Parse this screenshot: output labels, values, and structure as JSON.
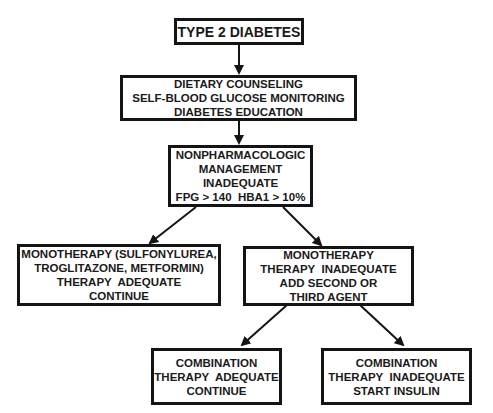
{
  "diagram": {
    "type": "flowchart",
    "nodes": {
      "start": {
        "lines": [
          "TYPE 2 DIABETES"
        ]
      },
      "lifestyle": {
        "lines": [
          "DIETARY COUNSELING",
          "SELF-BLOOD GLUCOSE MONITORING",
          "DIABETES EDUCATION"
        ]
      },
      "nonpharm": {
        "lines": [
          "NONPHARMACOLOGIC",
          "MANAGEMENT",
          "INADEQUATE",
          "FPG > 140  HBA1 > 10%"
        ]
      },
      "mono_adequate": {
        "lines": [
          "MONOTHERAPY (SULFONYLUREA,",
          "TROGLITAZONE, METFORMIN)",
          "THERAPY  ADEQUATE",
          "CONTINUE"
        ]
      },
      "mono_inadequate": {
        "lines": [
          "MONOTHERAPY",
          "THERAPY  INADEQUATE",
          "ADD SECOND OR",
          "THIRD AGENT"
        ]
      },
      "combo_adequate": {
        "lines": [
          "COMBINATION",
          "THERAPY  ADEQUATE",
          "CONTINUE"
        ]
      },
      "combo_inadequate": {
        "lines": [
          "COMBINATION",
          "THERAPY  INADEQUATE",
          "START INSULIN"
        ]
      }
    },
    "edges": [
      [
        "start",
        "lifestyle"
      ],
      [
        "lifestyle",
        "nonpharm"
      ],
      [
        "nonpharm",
        "mono_adequate"
      ],
      [
        "nonpharm",
        "mono_inadequate"
      ],
      [
        "mono_inadequate",
        "combo_adequate"
      ],
      [
        "mono_inadequate",
        "combo_inadequate"
      ]
    ],
    "colors": {
      "stroke": "#141414",
      "text": "#1a1a1a",
      "background": "#ffffff"
    }
  }
}
